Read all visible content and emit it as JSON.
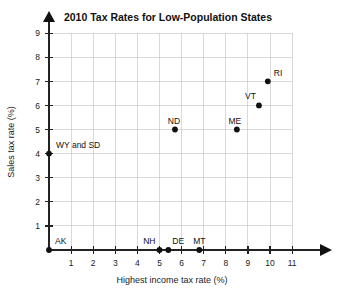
{
  "chart_data": {
    "type": "scatter",
    "title": "2010 Tax Rates for Low-Population States",
    "xlabel": "Highest income tax rate (%)",
    "ylabel": "Sales tax rate (%)",
    "xlim": [
      0,
      11
    ],
    "ylim": [
      0,
      9
    ],
    "xticks": [
      "1",
      "2",
      "3",
      "4",
      "5",
      "6",
      "7",
      "8",
      "9",
      "10",
      "11"
    ],
    "xtick_values": [
      1,
      2,
      3,
      4,
      5,
      6,
      7,
      8,
      9,
      10,
      11
    ],
    "yticks": [
      "1",
      "2",
      "3",
      "4",
      "5",
      "6",
      "7",
      "8",
      "9"
    ],
    "ytick_values": [
      1,
      2,
      3,
      4,
      5,
      6,
      7,
      8,
      9
    ],
    "grid": true,
    "legend": "none",
    "point_color": "#111111",
    "grid_color": "#c9c9c9",
    "axis_color": "#222222",
    "points": [
      {
        "label": "AK",
        "x": 0,
        "y": 0,
        "label_dx": 6,
        "label_dy": -6
      },
      {
        "label": "WY and SD",
        "x": 0,
        "y": 4,
        "label_dx": 7,
        "label_dy": -6
      },
      {
        "label": "NH",
        "x": 5.0,
        "y": 0,
        "label_dx": -4,
        "label_dy": -6
      },
      {
        "label": "DE",
        "x": 5.4,
        "y": 0,
        "label_dx": 4,
        "label_dy": -6
      },
      {
        "label": "MT",
        "x": 6.8,
        "y": 0,
        "label_dx": 0,
        "label_dy": -6
      },
      {
        "label": "ND",
        "x": 5.7,
        "y": 5.0,
        "label_dx": -1,
        "label_dy": -6
      },
      {
        "label": "ME",
        "x": 8.5,
        "y": 5.0,
        "label_dx": -2,
        "label_dy": -6
      },
      {
        "label": "VT",
        "x": 9.5,
        "y": 6.0,
        "label_dx": -3,
        "label_dy": -6
      },
      {
        "label": "RI",
        "x": 9.9,
        "y": 7.0,
        "label_dx": 6,
        "label_dy": -5
      }
    ]
  }
}
